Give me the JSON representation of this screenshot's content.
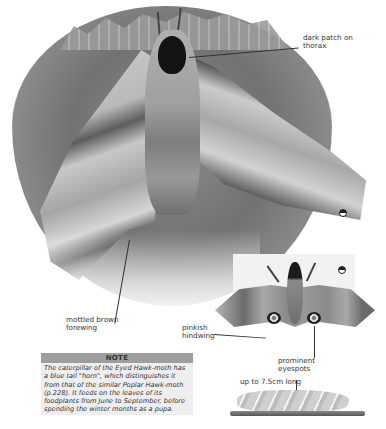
{
  "page": {
    "subject": "Eyed Hawk-moth"
  },
  "main_illustration": {
    "labels": {
      "thorax": "dark patch on thorax",
      "forewing": "mottled brown forewing"
    },
    "gender_symbol": "female-icon"
  },
  "inset_illustration": {
    "gender_symbol": "female-icon",
    "labels": {
      "hindwing": "pinkish hindwing",
      "eyespots": "prominent eyespots"
    }
  },
  "caterpillar": {
    "label": "up to 7.5cm long"
  },
  "note": {
    "title": "NOTE",
    "text": "The caterpillar of the Eyed Hawk-moth has a blue tail \"horn\", which distinguishes it from that of the similar Poplar Hawk-moth (p.228). It feeds on the leaves of its foodplants from June to September, before spending the winter months as a pupa."
  },
  "colors": {
    "note_header_bg": "#9e9e9e",
    "note_body_bg": "#eeeeee",
    "text": "#333333"
  }
}
